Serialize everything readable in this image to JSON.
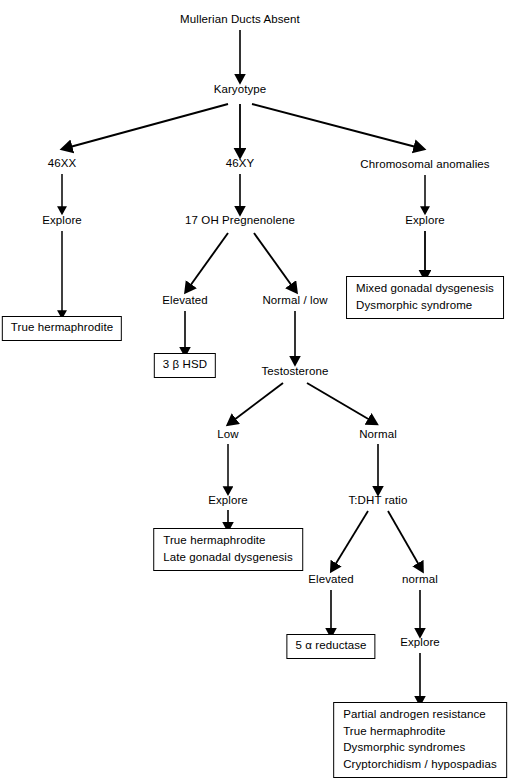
{
  "diagram": {
    "title": "Mullerian Ducts Absent",
    "type": "flowchart",
    "orientation": "top-down",
    "line_color": "#000000",
    "background_color": "#ffffff",
    "nodes": {
      "root": {
        "label": "Mullerian Ducts Absent",
        "shape": "plain"
      },
      "karyotype": {
        "label": "Karyotype",
        "shape": "plain"
      },
      "k_46xx": {
        "label": "46XX",
        "shape": "plain"
      },
      "k_46xy": {
        "label": "46XY",
        "shape": "plain"
      },
      "k_chrom": {
        "label": "Chromosomal anomalies",
        "shape": "plain"
      },
      "explore_left": {
        "label": "Explore",
        "shape": "plain"
      },
      "explore_right": {
        "label": "Explore",
        "shape": "plain"
      },
      "box_true_herm": {
        "label": "True  hermaphrodite",
        "shape": "box"
      },
      "box_mixed": {
        "shape": "box",
        "lines": [
          "Mixed gonadal dysgenesis",
          "Dysmorphic  syndrome"
        ]
      },
      "pregnenolene": {
        "label": "17 OH Pregnenolene",
        "shape": "plain"
      },
      "p_elevated": {
        "label": "Elevated",
        "shape": "plain"
      },
      "p_normal_low": {
        "label": "Normal  /  low",
        "shape": "plain"
      },
      "box_3bhsd": {
        "label": "3 β HSD",
        "shape": "box"
      },
      "testosterone": {
        "label": "Testosterone",
        "shape": "plain"
      },
      "t_low": {
        "label": "Low",
        "shape": "plain"
      },
      "t_normal": {
        "label": "Normal",
        "shape": "plain"
      },
      "explore_low": {
        "label": "Explore",
        "shape": "plain"
      },
      "box_true_herm_late": {
        "shape": "box",
        "lines": [
          "True  hermaphrodite",
          "Late gonadal dysgenesis"
        ]
      },
      "tdht": {
        "label": "T:DHT ratio",
        "shape": "plain"
      },
      "d_elevated": {
        "label": "Elevated",
        "shape": "plain"
      },
      "d_normal": {
        "label": "normal",
        "shape": "plain"
      },
      "box_5a_reductase": {
        "label": "5 α reductase",
        "shape": "box"
      },
      "explore_final": {
        "label": "Explore",
        "shape": "plain"
      },
      "box_final": {
        "shape": "box",
        "lines": [
          "Partial  androgen  resistance",
          "True  hermaphrodite",
          "Dysmorphic  syndromes",
          "Cryptorchidism  /  hypospadias"
        ]
      }
    },
    "edges": [
      {
        "from": "root",
        "to": "karyotype",
        "kind": "straight-arrow"
      },
      {
        "from": "karyotype",
        "to": "k_46xx",
        "kind": "diagonal-arrow"
      },
      {
        "from": "karyotype",
        "to": "k_46xy",
        "kind": "straight-arrow"
      },
      {
        "from": "karyotype",
        "to": "k_chrom",
        "kind": "diagonal-arrow"
      },
      {
        "from": "k_46xx",
        "to": "explore_left",
        "kind": "straight-arrow"
      },
      {
        "from": "explore_left",
        "to": "box_true_herm",
        "kind": "straight-arrow"
      },
      {
        "from": "k_chrom",
        "to": "explore_right",
        "kind": "straight-arrow"
      },
      {
        "from": "explore_right",
        "to": "box_mixed",
        "kind": "straight-arrow"
      },
      {
        "from": "k_46xy",
        "to": "pregnenolene",
        "kind": "straight-arrow"
      },
      {
        "from": "pregnenolene",
        "to": "p_elevated",
        "kind": "diagonal-arrow"
      },
      {
        "from": "pregnenolene",
        "to": "p_normal_low",
        "kind": "diagonal-arrow"
      },
      {
        "from": "p_elevated",
        "to": "box_3bhsd",
        "kind": "straight-arrow"
      },
      {
        "from": "p_normal_low",
        "to": "testosterone",
        "kind": "straight-arrow"
      },
      {
        "from": "testosterone",
        "to": "t_low",
        "kind": "diagonal-arrow"
      },
      {
        "from": "testosterone",
        "to": "t_normal",
        "kind": "diagonal-arrow"
      },
      {
        "from": "t_low",
        "to": "explore_low",
        "kind": "straight-arrow"
      },
      {
        "from": "explore_low",
        "to": "box_true_herm_late",
        "kind": "straight-arrow"
      },
      {
        "from": "t_normal",
        "to": "tdht",
        "kind": "straight-arrow"
      },
      {
        "from": "tdht",
        "to": "d_elevated",
        "kind": "diagonal-arrow"
      },
      {
        "from": "tdht",
        "to": "d_normal",
        "kind": "diagonal-arrow"
      },
      {
        "from": "d_elevated",
        "to": "box_5a_reductase",
        "kind": "straight-arrow"
      },
      {
        "from": "d_normal",
        "to": "explore_final",
        "kind": "straight-arrow"
      },
      {
        "from": "explore_final",
        "to": "box_final",
        "kind": "straight-arrow"
      }
    ]
  }
}
